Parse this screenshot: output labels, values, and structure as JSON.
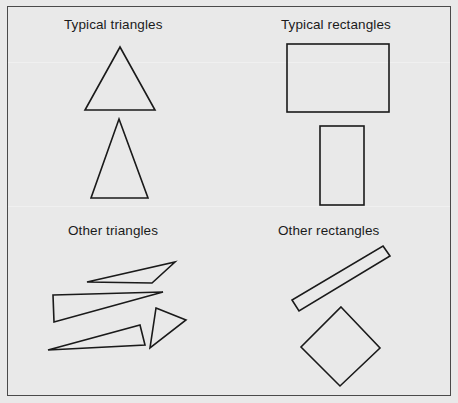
{
  "figure": {
    "background_color": "#e9e9e9",
    "border_color": "#4a4a4a",
    "stroke_color": "#1a1a1a",
    "width": 458,
    "height": 403,
    "groups": [
      {
        "id": "typical-triangles",
        "label": "Typical triangles",
        "label_x": 64,
        "label_y": 18,
        "shapes": [
          {
            "name": "equilateral-triangle",
            "type": "polygon",
            "points": "120,47 155,110 85,110"
          },
          {
            "name": "isosceles-triangle",
            "type": "polygon",
            "points": "119,119 148,198 91,198"
          }
        ]
      },
      {
        "id": "typical-rectangles",
        "label": "Typical rectangles",
        "label_x": 281,
        "label_y": 18,
        "shapes": [
          {
            "name": "wide-rectangle",
            "type": "rect",
            "x": 287,
            "y": 44,
            "width": 102,
            "height": 68
          },
          {
            "name": "tall-rectangle",
            "type": "rect",
            "x": 320,
            "y": 126,
            "width": 44,
            "height": 79
          }
        ]
      },
      {
        "id": "other-triangles",
        "label": "Other triangles",
        "label_x": 68,
        "label_y": 224,
        "shapes": [
          {
            "name": "sliver-triangle-upper",
            "type": "polygon",
            "points": "87,282 175,262 152,283"
          },
          {
            "name": "sliver-triangle-left-wedge",
            "type": "polygon",
            "points": "53,295 163,292 54,322"
          },
          {
            "name": "sliver-triangle-lower",
            "type": "polygon",
            "points": "48,350 140,325 145,345"
          },
          {
            "name": "obtuse-triangle-right",
            "type": "polygon",
            "points": "156,308 186,320 150,348"
          }
        ]
      },
      {
        "id": "other-rectangles",
        "label": "Other rectangles",
        "label_x": 278,
        "label_y": 224,
        "shapes": [
          {
            "name": "thin-rotated-rectangle",
            "type": "polygon",
            "points": "383,246 390,256 299,311 292,300"
          },
          {
            "name": "diamond-rotated-square",
            "type": "polygon",
            "points": "341,307 380,348 340,386 301,347"
          }
        ]
      }
    ]
  }
}
